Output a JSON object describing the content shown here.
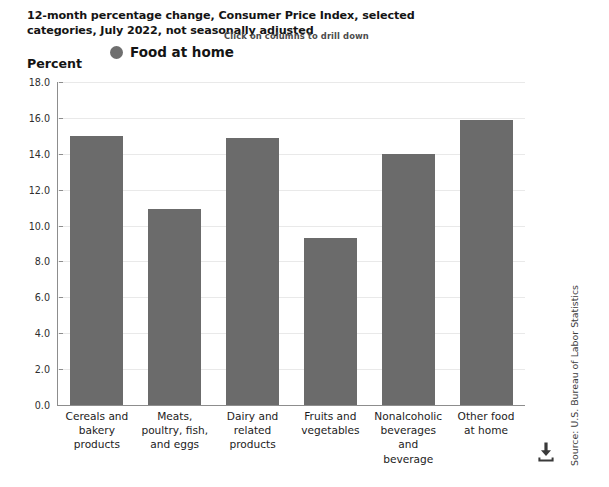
{
  "title": "12-month percentage change, Consumer Price Index, selected categories, July 2022, not seasonally adjusted",
  "drilldown_hint": "Click on columns to drill down",
  "legend": {
    "series_label": "Food at home",
    "marker_icon": "circle-marker-icon",
    "marker_color": "#6f6f6f"
  },
  "axis_title_y": "Percent",
  "source": "Source: U.S. Bureau of Labor Statistics",
  "download": {
    "icon": "download-icon",
    "label": "Download"
  },
  "chart_data": {
    "type": "bar",
    "title": "12-month percentage change, Consumer Price Index, selected categories, July 2022, not seasonally adjusted",
    "xlabel": "",
    "ylabel": "Percent",
    "ylim": [
      0.0,
      18.0
    ],
    "ytick_step": 2.0,
    "yticks": [
      "18.0",
      "16.0",
      "14.0",
      "12.0",
      "10.0",
      "8.0",
      "6.0",
      "4.0",
      "2.0",
      "0.0"
    ],
    "ytick_values": [
      18.0,
      16.0,
      14.0,
      12.0,
      10.0,
      8.0,
      6.0,
      4.0,
      2.0,
      0.0
    ],
    "grid": true,
    "legend_position": "top",
    "bar_color": "#6b6b6b",
    "categories": [
      "Cereals and bakery products",
      "Meats, poultry, fish, and eggs",
      "Dairy and related products",
      "Fruits and vegetables",
      "Nonalcoholic beverages and beverage",
      "Other food at home"
    ],
    "category_lines": [
      [
        "Cereals and",
        "bakery",
        "products"
      ],
      [
        "Meats,",
        "poultry, fish,",
        "and eggs"
      ],
      [
        "Dairy and",
        "related",
        "products"
      ],
      [
        "Fruits and",
        "vegetables"
      ],
      [
        "Nonalcoholic",
        "beverages",
        "and",
        "beverage"
      ],
      [
        "Other food",
        "at home"
      ]
    ],
    "series": [
      {
        "name": "Food at home",
        "values": [
          15.0,
          10.9,
          14.9,
          9.3,
          14.0,
          15.9
        ]
      }
    ]
  }
}
